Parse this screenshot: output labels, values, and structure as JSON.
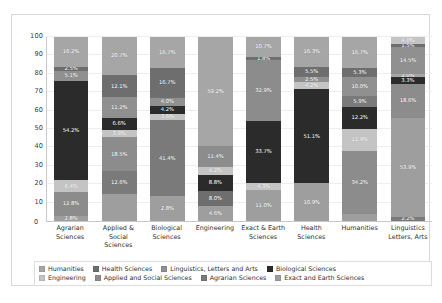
{
  "chart_data": {
    "type": "bar",
    "subtype": "100% stacked bar",
    "title": "",
    "subtitle": "",
    "xlabel": "",
    "ylabel": "",
    "ylim": [
      0,
      100
    ],
    "yticks": [
      0,
      10,
      20,
      30,
      40,
      50,
      60,
      70,
      80,
      90,
      100
    ],
    "ytick_labels": [
      "0",
      "10",
      "20",
      "30",
      "40",
      "50",
      "60",
      "70",
      "80",
      "90",
      "100"
    ],
    "grid": true,
    "legend_position": "bottom",
    "categories": [
      "Agrarian\nSciences",
      "Applied & Social\nSciences",
      "Biological\nSciences",
      "Engineering",
      "Exact & Earth\nSciences",
      "Health\nSciences",
      "Humanities",
      "Linguistics\nLetters, Arts"
    ],
    "series": [
      {
        "name": "Humanities",
        "color": "#a6a6a6",
        "values": [
          16.2,
          20.7,
          16.7,
          0.0,
          10.7,
          16.3,
          16.7,
          8.8
        ]
      },
      {
        "name": "Health Sciences",
        "color": "#6e6e6e",
        "values": [
          2.5,
          12.1,
          0.0,
          0.0,
          1.8,
          0.0,
          5.3,
          1.5
        ]
      },
      {
        "name": "Linguistics, Letters and Arts",
        "color": "#909090",
        "values": [
          5.1,
          11.2,
          0.0,
          0.0,
          0.0,
          5.5,
          0.0,
          14.5
        ]
      },
      {
        "name": "Biological Sciences",
        "color": "#2b2b2b",
        "values": [
          0.0,
          6.6,
          0.0,
          0.0,
          0.0,
          2.5,
          0.0,
          2.0
        ]
      },
      {
        "name": "Engineering",
        "color": "#c4c4c4",
        "values": [
          0.0,
          3.9,
          0.0,
          0.0,
          0.0,
          4.2,
          0.0,
          3.3
        ]
      },
      {
        "name": "Applied and Social Sciences",
        "color": "#8c8c8c",
        "values": [
          0.0,
          18.5,
          0.0,
          0.0,
          0.0,
          0.0,
          18.6,
          18.6
        ]
      },
      {
        "name": "Agrarian Sciences",
        "color": "#7a7a7a",
        "values": [
          54.2,
          0.0,
          10.7,
          0.0,
          0.0,
          0.0,
          5.9,
          0.0
        ]
      },
      {
        "name": "Exact and Earth Sciences",
        "color": "#9e9e9e",
        "values": [
          0.0,
          0.0,
          0.0,
          0.0,
          0.0,
          0.0,
          0.0,
          0.0
        ]
      }
    ],
    "bars": [
      {
        "category": "Agrarian Sciences",
        "segments": [
          {
            "series": "Humanities",
            "value": 16.2,
            "label": "16.2%",
            "color": "#a6a6a6"
          },
          {
            "series": "Health Sciences",
            "value": 2.5,
            "label": "2.5%",
            "color": "#6e6e6e"
          },
          {
            "series": "Linguistics, Letters and Arts",
            "value": 5.1,
            "label": "5.1%",
            "color": "#909090"
          },
          {
            "series": "Biological Sciences",
            "value": 54.2,
            "label": "54.2%",
            "color": "#2b2b2b"
          },
          {
            "series": "Engineering",
            "value": 6.4,
            "label": "6.4%",
            "color": "#c4c4c4"
          },
          {
            "series": "Applied and Social Sciences",
            "value": 12.8,
            "label": "12.8%",
            "color": "#8c8c8c"
          },
          {
            "series": "Exact and Earth Sciences",
            "value": 2.8,
            "label": "2.8%",
            "color": "#9e9e9e"
          }
        ]
      },
      {
        "category": "Applied & Social Sciences",
        "segments": [
          {
            "series": "Humanities",
            "value": 20.7,
            "label": "20.7%",
            "color": "#a6a6a6"
          },
          {
            "series": "Health Sciences",
            "value": 12.1,
            "label": "12.1%",
            "color": "#6e6e6e"
          },
          {
            "series": "Linguistics, Letters and Arts",
            "value": 11.2,
            "label": "11.2%",
            "color": "#909090"
          },
          {
            "series": "Biological Sciences",
            "value": 6.6,
            "label": "6.6%",
            "color": "#2b2b2b"
          },
          {
            "series": "Engineering",
            "value": 3.9,
            "label": "3.9%",
            "color": "#c4c4c4"
          },
          {
            "series": "Applied and Social Sciences",
            "value": 18.5,
            "label": "18.5%",
            "color": "#8c8c8c"
          },
          {
            "series": "Agrarian Sciences",
            "value": 12.6,
            "label": "12.6%",
            "color": "#7a7a7a"
          },
          {
            "series": "Exact and Earth Sciences",
            "value": 14.4,
            "label": "",
            "color": "#9e9e9e"
          }
        ]
      },
      {
        "category": "Biological Sciences",
        "segments": [
          {
            "series": "Humanities",
            "value": 16.7,
            "label": "16.7%",
            "color": "#a6a6a6"
          },
          {
            "series": "Health Sciences",
            "value": 16.7,
            "label": "16.7%",
            "color": "#6e6e6e"
          },
          {
            "series": "Linguistics, Letters and Arts",
            "value": 4.0,
            "label": "4.0%",
            "color": "#909090"
          },
          {
            "series": "Biological Sciences",
            "value": 4.2,
            "label": "4.2%",
            "color": "#2b2b2b"
          },
          {
            "series": "Engineering",
            "value": 3.6,
            "label": "3.6%",
            "color": "#c4c4c4"
          },
          {
            "series": "Agrarian Sciences",
            "value": 41.4,
            "label": "41.4%",
            "color": "#7a7a7a"
          },
          {
            "series": "Exact and Earth Sciences",
            "value": 13.4,
            "label": "2.8%",
            "color": "#9e9e9e"
          }
        ]
      },
      {
        "category": "Engineering",
        "segments": [
          {
            "series": "Humanities",
            "value": 59.2,
            "label": "59.2%",
            "color": "#a6a6a6"
          },
          {
            "series": "Applied and Social Sciences",
            "value": 11.4,
            "label": "11.4%",
            "color": "#8c8c8c"
          },
          {
            "series": "Engineering",
            "value": 4.2,
            "label": "4.2%",
            "color": "#c4c4c4"
          },
          {
            "series": "Biological Sciences",
            "value": 8.8,
            "label": "8.8%",
            "color": "#2b2b2b"
          },
          {
            "series": "Health Sciences",
            "value": 8.0,
            "label": "8.0%",
            "color": "#6e6e6e"
          },
          {
            "series": "Exact and Earth Sciences",
            "value": 8.4,
            "label": "4.6%",
            "color": "#9e9e9e"
          }
        ]
      },
      {
        "category": "Exact & Earth Sciences",
        "segments": [
          {
            "series": "Humanities",
            "value": 10.7,
            "label": "10.7%",
            "color": "#a6a6a6"
          },
          {
            "series": "Health Sciences",
            "value": 1.8,
            "label": "1.8%",
            "color": "#6e6e6e"
          },
          {
            "series": "Applied and Social Sciences",
            "value": 32.9,
            "label": "32.9%",
            "color": "#8c8c8c"
          },
          {
            "series": "Biological Sciences",
            "value": 33.7,
            "label": "33.7%",
            "color": "#2b2b2b"
          },
          {
            "series": "Engineering",
            "value": 4.3,
            "label": "4.3%",
            "color": "#c4c4c4"
          },
          {
            "series": "Exact and Earth Sciences",
            "value": 16.6,
            "label": "11.0%",
            "color": "#9e9e9e"
          }
        ]
      },
      {
        "category": "Health Sciences",
        "segments": [
          {
            "series": "Humanities",
            "value": 16.3,
            "label": "16.3%",
            "color": "#a6a6a6"
          },
          {
            "series": "Health Sciences",
            "value": 5.5,
            "label": "5.5%",
            "color": "#6e6e6e"
          },
          {
            "series": "Linguistics, Letters and Arts",
            "value": 2.5,
            "label": "2.5%",
            "color": "#909090"
          },
          {
            "series": "Engineering",
            "value": 4.2,
            "label": "4.2%",
            "color": "#c4c4c4"
          },
          {
            "series": "Biological Sciences",
            "value": 51.1,
            "label": "51.1%",
            "color": "#2b2b2b"
          },
          {
            "series": "Exact and Earth Sciences",
            "value": 20.4,
            "label": "10.9%",
            "color": "#9e9e9e"
          }
        ]
      },
      {
        "category": "Humanities",
        "segments": [
          {
            "series": "Humanities",
            "value": 16.7,
            "label": "16.7%",
            "color": "#a6a6a6"
          },
          {
            "series": "Health Sciences",
            "value": 5.3,
            "label": "5.3%",
            "color": "#6e6e6e"
          },
          {
            "series": "Linguistics, Letters and Arts",
            "value": 10.0,
            "label": "10.0%",
            "color": "#909090"
          },
          {
            "series": "Agrarian Sciences",
            "value": 5.9,
            "label": "5.9%",
            "color": "#7a7a7a"
          },
          {
            "series": "Biological Sciences",
            "value": 12.2,
            "label": "12.2%",
            "color": "#2b2b2b"
          },
          {
            "series": "Engineering",
            "value": 11.9,
            "label": "11.9%",
            "color": "#c4c4c4"
          },
          {
            "series": "Applied and Social Sciences",
            "value": 34.2,
            "label": "34.2%",
            "color": "#8c8c8c"
          },
          {
            "series": "Exact and Earth Sciences",
            "value": 3.8,
            "label": "",
            "color": "#9e9e9e"
          }
        ]
      },
      {
        "category": "Linguistics Letters, Arts",
        "segments": [
          {
            "series": "Engineering",
            "value": 4.0,
            "label": "4.0%",
            "color": "#c4c4c4"
          },
          {
            "series": "Health Sciences",
            "value": 1.5,
            "label": "1.5%",
            "color": "#6e6e6e"
          },
          {
            "series": "Linguistics, Letters and Arts",
            "value": 14.5,
            "label": "14.5%",
            "color": "#909090"
          },
          {
            "series": "Humanities",
            "value": 2.0,
            "label": "2.0%",
            "color": "#a6a6a6"
          },
          {
            "series": "Biological Sciences",
            "value": 3.3,
            "label": "3.3%",
            "color": "#2b2b2b"
          },
          {
            "series": "Applied and Social Sciences",
            "value": 18.6,
            "label": "18.6%",
            "color": "#8c8c8c"
          },
          {
            "series": "Exact and Earth Sciences",
            "value": 53.9,
            "label": "53.9%",
            "color": "#9e9e9e"
          },
          {
            "series": "Agrarian Sciences",
            "value": 2.2,
            "label": "2.2%",
            "color": "#7a7a7a"
          }
        ]
      }
    ],
    "legend": [
      {
        "label": "Humanities",
        "color": "#a6a6a6"
      },
      {
        "label": "Health Sciences",
        "color": "#6e6e6e"
      },
      {
        "label": "Linguistics, Letters and Arts",
        "color": "#909090"
      },
      {
        "label": "Biological Sciences",
        "color": "#2b2b2b"
      },
      {
        "label": "Engineering",
        "color": "#c4c4c4"
      },
      {
        "label": "Applied and Social Sciences",
        "color": "#8c8c8c"
      },
      {
        "label": "Agrarian Sciences",
        "color": "#7a7a7a"
      },
      {
        "label": "Exact and Earth Sciences",
        "color": "#9e9e9e"
      }
    ]
  }
}
